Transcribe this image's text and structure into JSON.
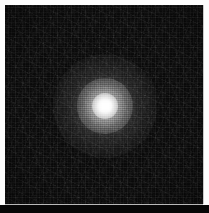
{
  "image": {
    "kind": "astronomical-grayscale-cutout",
    "title": "Point source cutout",
    "width_px": 209,
    "height_px": 213,
    "colorspace": "grayscale",
    "has_axes": false,
    "has_labels": false,
    "has_colorbar": false,
    "visible_text": ""
  },
  "frame": {
    "border_color": "#fdfdfd",
    "border_width_px": 5,
    "data_left_px": 5,
    "data_top_px": 5,
    "data_width_px": 198,
    "data_height_px": 199,
    "bottom_rule_color": "#b9b9b9",
    "bottom_rule_y_px": 204,
    "right_rule_color": "#c9c9c9",
    "right_rule_x_px": 203,
    "below_frame_color": "#070707",
    "below_frame_top_px": 205,
    "below_frame_height_px": 8
  },
  "background": {
    "name": "sky-background",
    "base_color": "#0d0d0d",
    "min_color": "#050505",
    "max_color": "#242424",
    "noise_character": "pixel-scale detector read noise",
    "noise_grain_px": 2
  },
  "source": {
    "name": "point-source",
    "description": "unresolved bright object with gaussian point spread function",
    "center_x_px": 105,
    "center_y_px": 106,
    "peak_color": "#ffffff",
    "core_color": "#f2f2f2",
    "halo_color": "#8a8a8a",
    "core_radius_px": 9,
    "inner_halo_radius_px": 26,
    "outer_halo_radius_px": 48,
    "peak_intensity": 255,
    "profile": "gaussian"
  },
  "layers": {
    "halo_outer": {
      "center_x_px": 105,
      "center_y_px": 106,
      "diameter_px": 104,
      "stops": [
        {
          "offset": "0%",
          "color": "rgba(255,255,255,0.30)"
        },
        {
          "offset": "22%",
          "color": "rgba(255,255,255,0.22)"
        },
        {
          "offset": "45%",
          "color": "rgba(255,255,255,0.10)"
        },
        {
          "offset": "70%",
          "color": "rgba(255,255,255,0.035)"
        },
        {
          "offset": "100%",
          "color": "rgba(255,255,255,0.0)"
        }
      ]
    },
    "halo_mid": {
      "center_x_px": 105,
      "center_y_px": 106,
      "diameter_px": 56,
      "stops": [
        {
          "offset": "0%",
          "color": "rgba(255,255,255,0.72)"
        },
        {
          "offset": "26%",
          "color": "rgba(255,255,255,0.50)"
        },
        {
          "offset": "55%",
          "color": "rgba(255,255,255,0.22)"
        },
        {
          "offset": "100%",
          "color": "rgba(255,255,255,0.0)"
        }
      ]
    },
    "core": {
      "center_x_px": 105,
      "center_y_px": 106,
      "diameter_px": 26,
      "stops": [
        {
          "offset": "0%",
          "color": "rgba(255,255,255,1.0)"
        },
        {
          "offset": "35%",
          "color": "rgba(255,255,255,0.88)"
        },
        {
          "offset": "68%",
          "color": "rgba(255,255,255,0.45)"
        },
        {
          "offset": "100%",
          "color": "rgba(255,255,255,0.0)"
        }
      ]
    },
    "core_peak": {
      "center_x_px": 105,
      "center_y_px": 106,
      "width_px": 11,
      "height_px": 10,
      "color": "#ffffff"
    },
    "vignette": {
      "strength": 0.3
    }
  }
}
